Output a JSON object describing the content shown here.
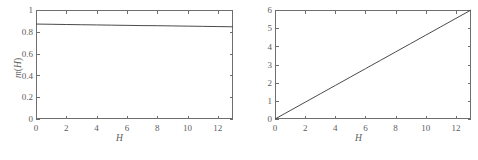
{
  "figure": {
    "background": "#ffffff",
    "axis_color": "#6e6e6e",
    "line_color": "#4a4a4a",
    "text_color": "#5d5d5d"
  },
  "caption": "",
  "chart_data": [
    {
      "type": "line",
      "panel": "left",
      "title": "",
      "xlabel": "H",
      "ylabel": "m(H)",
      "ylabel_parts": {
        "symbol": "m",
        "open": "(",
        "arg": "H",
        "close": ")"
      },
      "xlim": [
        0,
        13
      ],
      "ylim": [
        0,
        1
      ],
      "xticks": [
        0,
        2,
        4,
        6,
        8,
        10,
        12
      ],
      "xticklabels": [
        "0",
        "2",
        "4",
        "6",
        "8",
        "10",
        "12"
      ],
      "yticks": [
        0,
        0.2,
        0.4,
        0.6,
        0.8,
        1
      ],
      "yticklabels": [
        "0",
        "0.2",
        "0.4",
        "0.6",
        "0.8",
        "1"
      ],
      "grid": false,
      "legend": null,
      "series": [
        {
          "name": "m(H)",
          "x": [
            0,
            1,
            2,
            3,
            4,
            5,
            6,
            7,
            8,
            9,
            10,
            11,
            12,
            13
          ],
          "y": [
            0.871,
            0.869,
            0.867,
            0.865,
            0.863,
            0.861,
            0.859,
            0.857,
            0.856,
            0.854,
            0.852,
            0.85,
            0.848,
            0.846
          ]
        }
      ]
    },
    {
      "type": "line",
      "panel": "right",
      "title": "",
      "xlabel": "H",
      "ylabel": "σ²(H)",
      "ylabel_parts": {
        "symbol": "σ",
        "exponent": "2",
        "open": "(",
        "arg": "H",
        "close": ")"
      },
      "xlim": [
        0,
        13
      ],
      "ylim": [
        0,
        6
      ],
      "xticks": [
        0,
        2,
        4,
        6,
        8,
        10,
        12
      ],
      "xticklabels": [
        "0",
        "2",
        "4",
        "6",
        "8",
        "10",
        "12"
      ],
      "yticks": [
        0,
        1,
        2,
        3,
        4,
        5,
        6
      ],
      "yticklabels": [
        "0",
        "1",
        "2",
        "3",
        "4",
        "5",
        "6"
      ],
      "grid": false,
      "legend": null,
      "series": [
        {
          "name": "σ²(H)",
          "x": [
            0,
            1,
            2,
            3,
            4,
            5,
            6,
            7,
            8,
            9,
            10,
            11,
            12,
            13
          ],
          "y": [
            0.0,
            0.462,
            0.923,
            1.385,
            1.846,
            2.308,
            2.769,
            3.231,
            3.692,
            4.154,
            4.615,
            5.077,
            5.538,
            6.0
          ]
        }
      ]
    }
  ]
}
